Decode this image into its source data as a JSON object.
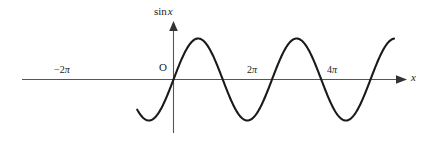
{
  "figure": {
    "title": "",
    "background_color": "#ffffff",
    "curve_color": "#1a1a1a",
    "axis_color": "#555555",
    "text_color": "#1a1a1a"
  },
  "labels": {
    "y_axis": "sin",
    "y_axis_variable": "x",
    "origin": "O",
    "x_axis": "x",
    "tick_neg_2pi_sign": "−",
    "tick_neg_2pi_num": "2",
    "tick_neg_2pi_sym": "π",
    "tick_2pi_num": "2",
    "tick_2pi_sym": "π",
    "tick_4pi_num": "4",
    "tick_4pi_sym": "π"
  },
  "chart_data": {
    "type": "line",
    "title": "",
    "xlabel": "x",
    "ylabel": "sin x",
    "function": "y = sin(x)",
    "grid": false,
    "legend": null,
    "axis_arrows": {
      "x_axis_arrow": "right",
      "y_axis_arrow": "up"
    },
    "xlim_radians": [
      -2.3141592653589793,
      13.0
    ],
    "ylim": [
      -1.25,
      1.25
    ],
    "amplitude": 1,
    "period_radians": 6.283185307179586,
    "xtick_values_radians": [
      -6.283185307179586,
      0,
      6.283185307179586,
      12.566370614359172
    ],
    "xtick_labels": [
      "−2π",
      "O",
      "2π",
      "4π"
    ],
    "ytick_values": [],
    "ytick_labels": [],
    "zero_crossings_radians": [
      -6.283185307179586,
      -3.141592653589793,
      0,
      3.141592653589793,
      6.283185307179586,
      9.42477796076938,
      12.566370614359172
    ],
    "maxima_radians": [
      -4.71238898038469,
      1.5707963267948966,
      7.853981633974483,
      14.137166941154069
    ],
    "minima_radians": [
      -1.5707963267948966,
      4.71238898038469,
      10.995574287564276
    ],
    "series": [
      {
        "name": "sin x",
        "x": [
          -2.3141592653589793,
          -2.0,
          -1.5707963267948966,
          -1.0,
          -0.5,
          0.0,
          0.5,
          1.0,
          1.5707963267948966,
          2.0,
          2.5,
          3.141592653589793,
          3.5,
          4.0,
          4.71238898038469,
          5.0,
          5.5,
          6.283185307179586,
          6.5,
          7.0,
          7.853981633974483,
          8.5,
          9.0,
          9.42477796076938,
          10.0,
          10.5,
          10.995574287564276,
          11.5,
          12.0,
          12.566370614359172,
          13.0
        ],
        "y": [
          -0.7357,
          -0.9093,
          -1.0,
          -0.8415,
          -0.4794,
          0.0,
          0.4794,
          0.8415,
          1.0,
          0.9093,
          0.5985,
          0.0,
          -0.3508,
          -0.7568,
          -1.0,
          -0.9589,
          -0.7055,
          0.0,
          0.2151,
          0.657,
          1.0,
          0.798,
          0.4121,
          0.0,
          -0.544,
          -0.8797,
          -1.0,
          -0.9093,
          -0.5366,
          0.0,
          0.4202
        ]
      }
    ]
  }
}
